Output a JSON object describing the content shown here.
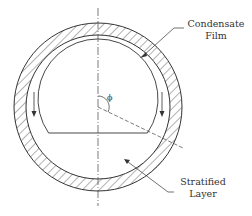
{
  "diagram": {
    "labels": {
      "condensate_film": [
        "Condensate",
        "Film"
      ],
      "stratified_layer": [
        "Stratified",
        "Layer"
      ],
      "angle_symbol": "ϕ"
    },
    "colors": {
      "line": "#333333",
      "hatch": "#555555",
      "background": "#ffffff"
    },
    "geometry": {
      "center": [
        98,
        107
      ],
      "outer_radius": 84,
      "inner_wall_radius": 72,
      "vapor_core_radius": 62,
      "stratified_chord_y": 133
    }
  }
}
